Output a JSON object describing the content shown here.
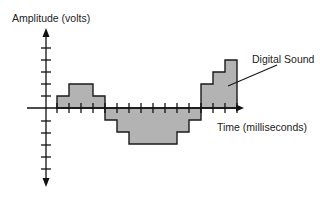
{
  "diagram": {
    "title": "",
    "y_axis_label": "Amplitude (volts)",
    "x_axis_label": "Time (milliseconds)",
    "callout_label": "Digital Sound",
    "colors": {
      "fill": "#b3b3b3",
      "stroke": "#1a1a1a",
      "axis": "#111111",
      "background": "#ffffff"
    }
  },
  "chart_data": {
    "type": "step",
    "title": "",
    "xlabel": "Time (milliseconds)",
    "ylabel": "Amplitude (volts)",
    "annotation": "Digital Sound",
    "sample_values": [
      1,
      2,
      2,
      1,
      -1,
      -2,
      -3,
      -3,
      -3,
      -3,
      -2,
      -1,
      2,
      3,
      4
    ],
    "y_ticks_positive": 5,
    "y_ticks_negative": 5,
    "ylim": [
      -6,
      6
    ],
    "grid": false
  }
}
